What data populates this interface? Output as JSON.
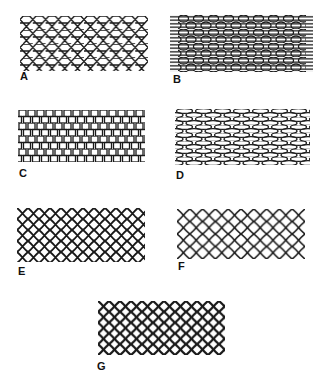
{
  "figure": {
    "panels": [
      {
        "id": "A",
        "label": "A",
        "pattern": "honeycomb-hexagon",
        "box": [
          20,
          16,
          128,
          55
        ],
        "label_pos": [
          20,
          71
        ]
      },
      {
        "id": "B",
        "label": "B",
        "pattern": "hexagon-with-horizontal-strands",
        "box": [
          170,
          15,
          143,
          57
        ],
        "label_pos": [
          173,
          74
        ]
      },
      {
        "id": "C",
        "label": "C",
        "pattern": "rectangular-brick",
        "box": [
          18,
          110,
          127,
          52
        ],
        "label_pos": [
          19,
          168
        ]
      },
      {
        "id": "D",
        "label": "D",
        "pattern": "elongated-hexagon",
        "box": [
          175,
          109,
          135,
          56
        ],
        "label_pos": [
          176,
          170
        ]
      },
      {
        "id": "E",
        "label": "E",
        "pattern": "rounded-diamond",
        "box": [
          17,
          208,
          128,
          54
        ],
        "label_pos": [
          18,
          266
        ]
      },
      {
        "id": "F",
        "label": "F",
        "pattern": "open-diamond",
        "box": [
          177,
          209,
          128,
          50
        ],
        "label_pos": [
          178,
          261
        ]
      },
      {
        "id": "G",
        "label": "G",
        "pattern": "dense-rounded-diamond",
        "box": [
          98,
          301,
          127,
          54
        ],
        "label_pos": [
          97,
          361
        ]
      }
    ],
    "stroke_color": "#1a1a1a",
    "background": "#ffffff"
  }
}
